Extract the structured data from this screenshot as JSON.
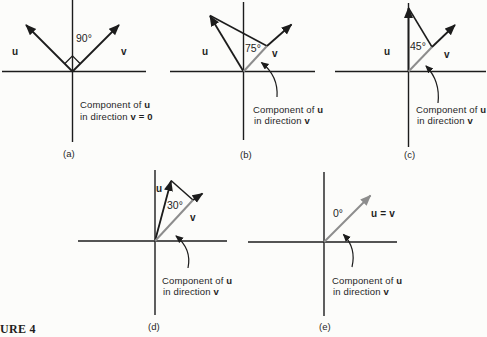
{
  "figure_label": "URE 4",
  "colors": {
    "ink": "#1c1c1c",
    "component_gray": "#8d8d8d",
    "background": "#fcfcfa"
  },
  "panels": {
    "a": {
      "tag": "(a)",
      "angle": "90°",
      "u_label": "u",
      "v_label": "v",
      "cap1": "Component of ",
      "cap1b": "u",
      "cap2": "in direction ",
      "cap2b": "v = 0"
    },
    "b": {
      "tag": "(b)",
      "angle": "75°",
      "u_label": "u",
      "v_label": "v",
      "cap1": "Component of ",
      "cap1b": "u",
      "cap2": "in direction ",
      "cap2b": "v"
    },
    "c": {
      "tag": "(c)",
      "angle": "45°",
      "u_label": "u",
      "v_label": "v",
      "cap1": "Component of ",
      "cap1b": "u",
      "cap2": "in direction ",
      "cap2b": "v"
    },
    "d": {
      "tag": "(d)",
      "angle": "30°",
      "u_label": "u",
      "v_label": "v",
      "cap1": "Component of ",
      "cap1b": "u",
      "cap2": "in direction ",
      "cap2b": "v"
    },
    "e": {
      "tag": "(e)",
      "angle": "0°",
      "uv_label": "u = v",
      "cap1": "Component of ",
      "cap1b": "u",
      "cap2": "in direction ",
      "cap2b": "v"
    }
  }
}
